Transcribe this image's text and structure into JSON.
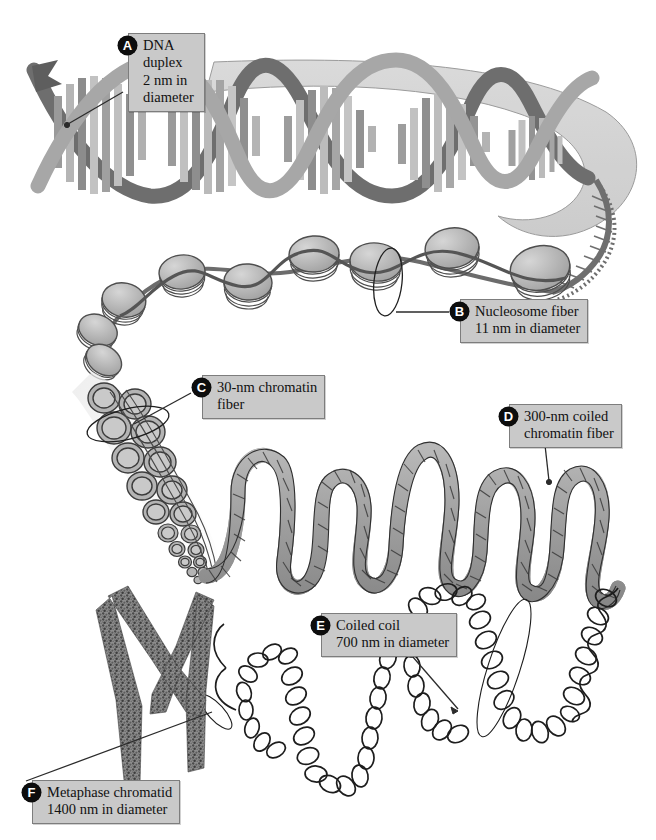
{
  "figure": {
    "background_color": "#ffffff",
    "ink_color": "#2b2b2b",
    "label_box_fill": "#c9c9c9",
    "label_box_border": "#7d7d7d",
    "badge_fill": "#0d0d0d",
    "badge_text_color": "#ffffff"
  },
  "callouts": [
    {
      "key": "A",
      "letter": "A",
      "text": "DNA\nduplex\n2 nm in\ndiameter",
      "name": "DNA duplex",
      "diameter": "2 nm",
      "box": {
        "left": 118,
        "top": 33,
        "width": 74
      },
      "leader": {
        "x1": 120,
        "y1": 92,
        "x2": 66,
        "y2": 124
      }
    },
    {
      "key": "B",
      "letter": "B",
      "text": "Nucleosome fiber\n11 nm in diameter",
      "name": "Nucleosome fiber",
      "diameter": "11 nm",
      "box": {
        "left": 450,
        "top": 299,
        "width": 137
      },
      "leader": {
        "x1": 450,
        "y1": 311,
        "x2": 388,
        "y2": 311
      }
    },
    {
      "key": "C",
      "letter": "C",
      "text": "30-nm chromatin\nfiber",
      "name": "30-nm chromatin fiber",
      "diameter": "30 nm",
      "box": {
        "left": 192,
        "top": 375,
        "width": 131
      },
      "leader": {
        "x1": 192,
        "y1": 392,
        "x2": 133,
        "y2": 424
      }
    },
    {
      "key": "D",
      "letter": "D",
      "text": "300-nm coiled\nchromatin fiber",
      "name": "300-nm coiled chromatin fiber",
      "diameter": "300 nm",
      "box": {
        "left": 499,
        "top": 404,
        "width": 126
      },
      "leader": {
        "x1": 545,
        "y1": 444,
        "x2": 548,
        "y2": 481
      }
    },
    {
      "key": "E",
      "letter": "E",
      "text": "Coiled coil\n700 nm in diameter",
      "name": "Coiled coil",
      "diameter": "700 nm",
      "box": {
        "left": 311,
        "top": 613,
        "width": 130
      },
      "leader": {
        "x1": 406,
        "y1": 648,
        "x2": 458,
        "y2": 710
      }
    },
    {
      "key": "F",
      "letter": "F",
      "text": "Metaphase chromatid\n1400 nm in diameter",
      "name": "Metaphase chromatid",
      "diameter": "1400 nm",
      "box": {
        "left": 22,
        "top": 780,
        "width": 155
      },
      "leader": {
        "x1": 24,
        "y1": 782,
        "x2": 213,
        "y2": 712
      }
    }
  ],
  "structures": [
    {
      "id": "dna-duplex",
      "label": "DNA double helix ribbon"
    },
    {
      "id": "nucleosome-fiber",
      "label": "Beads-on-a-string nucleosome fiber"
    },
    {
      "id": "chromatin-fiber-30nm",
      "label": "30-nm solenoid chromatin fiber"
    },
    {
      "id": "coiled-fiber-300nm",
      "label": "300-nm looped chromatin rope"
    },
    {
      "id": "coiled-coil-700nm",
      "label": "700-nm coiled coil spring"
    },
    {
      "id": "metaphase-chromatid",
      "label": "Metaphase chromatid"
    }
  ]
}
